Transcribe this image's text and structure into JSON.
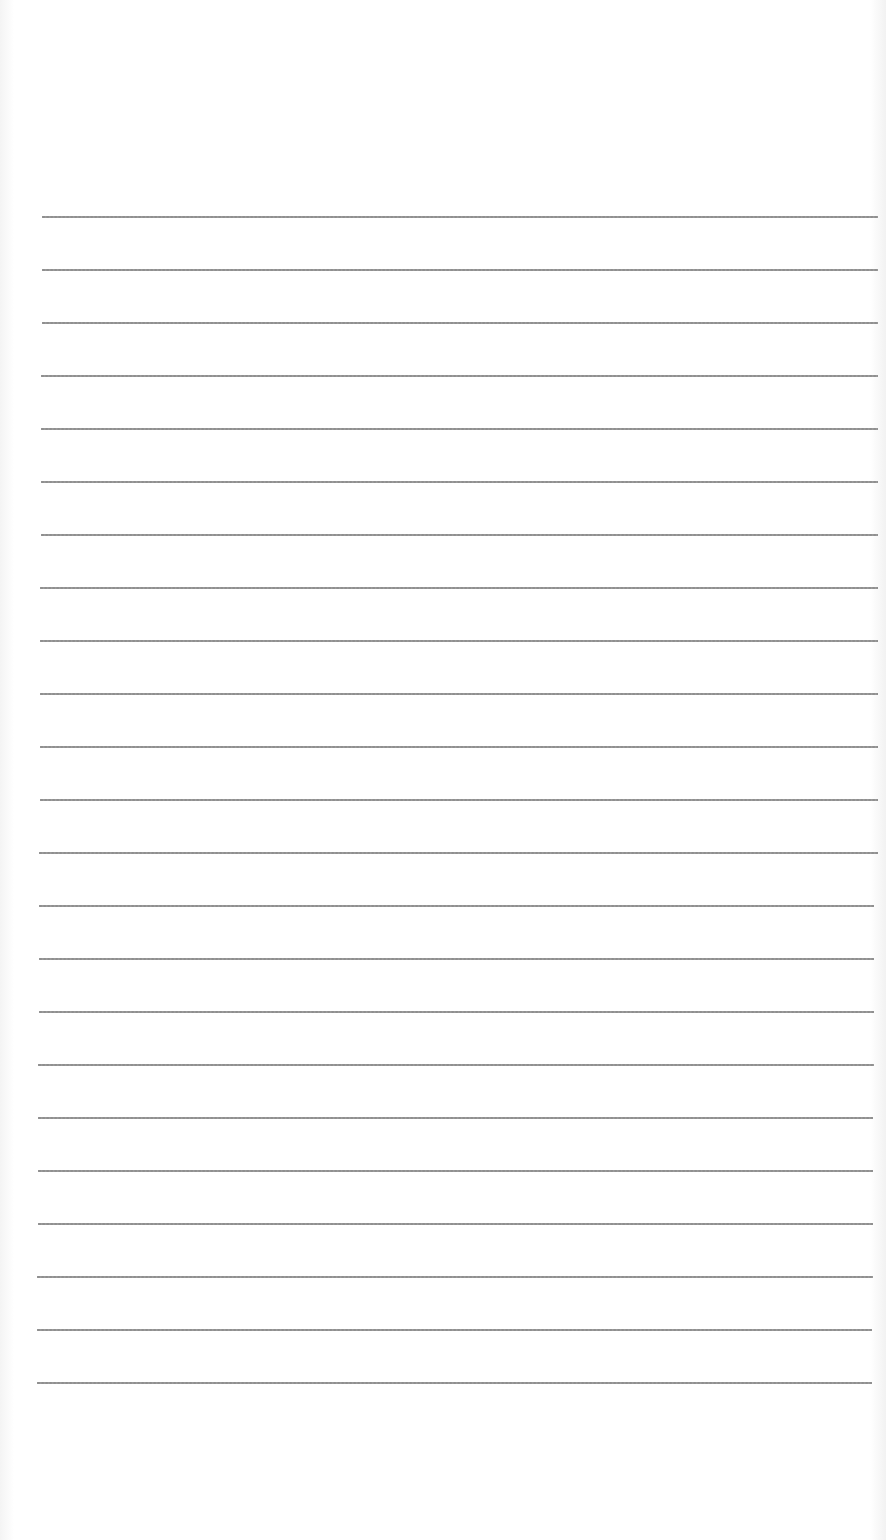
{
  "document": {
    "type": "lined-paper",
    "background_color": "#ffffff",
    "line_color": "#8a8a8a",
    "line_count": 23,
    "first_line_y": 216,
    "line_spacing": 53,
    "left_start_top": 42,
    "left_start_bottom": 37,
    "right_end": 878
  }
}
